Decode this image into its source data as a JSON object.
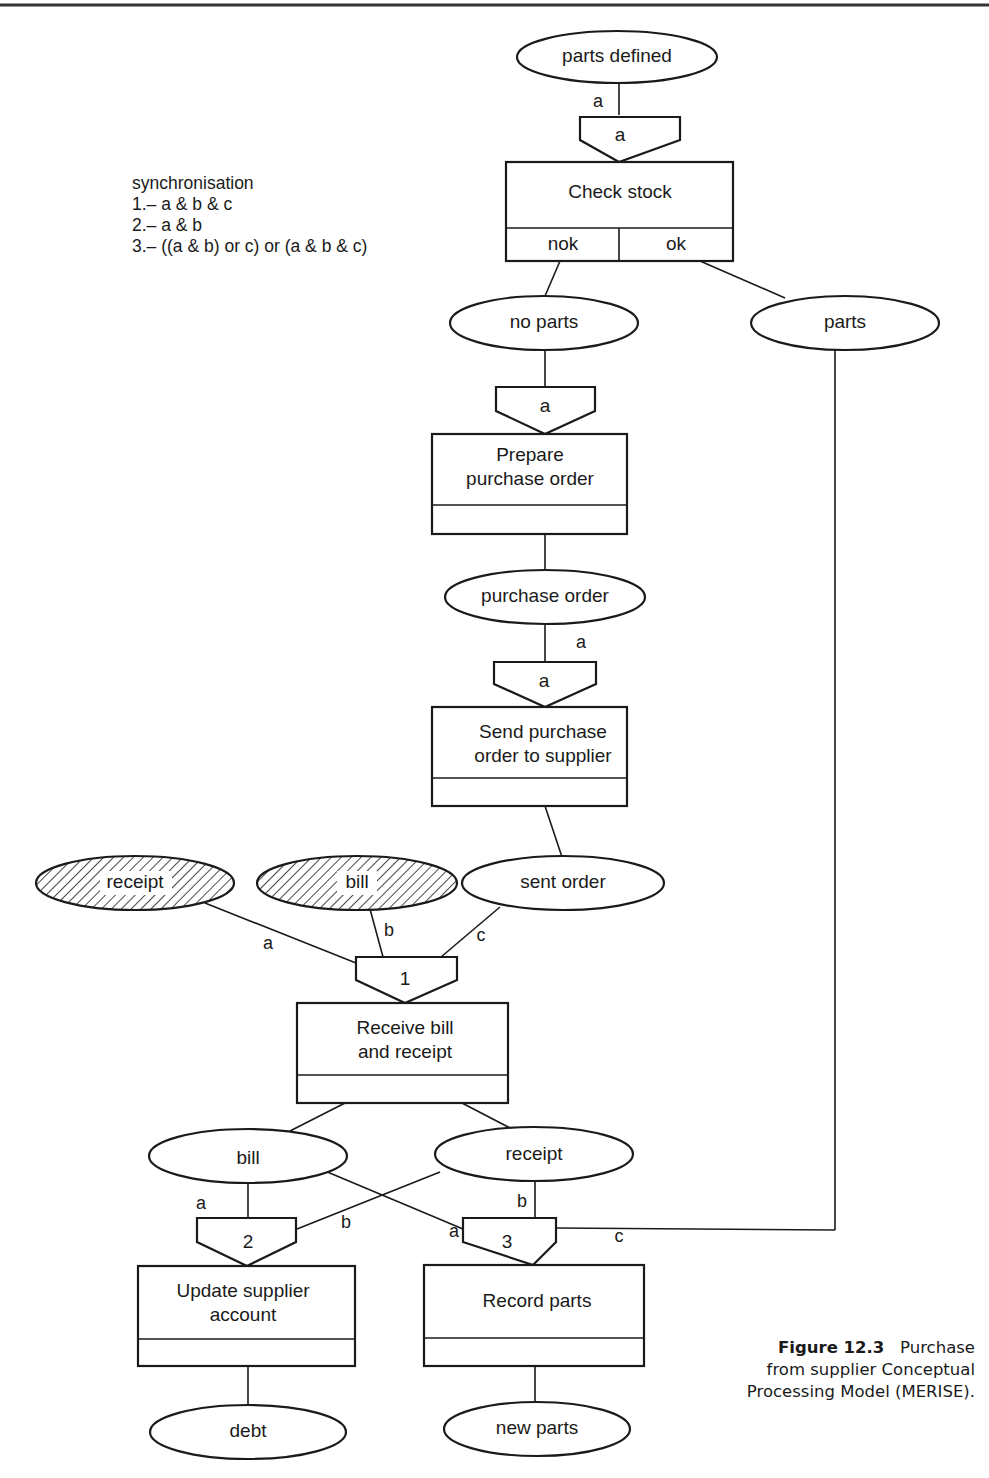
{
  "figure": {
    "caption": {
      "number": "Figure 12.3",
      "text_line1": "Purchase",
      "text_line2": "from supplier Conceptual",
      "text_line3": "Processing Model (MERISE)."
    },
    "synchronisation_legend": {
      "title": "synchronisation",
      "rules": [
        "1.– a & b & c",
        "2.– a & b",
        "3.– ((a & b) or c) or (a & b & c)"
      ]
    },
    "events": {
      "parts_defined": "parts defined",
      "no_parts": "no parts",
      "parts": "parts",
      "purchase_order": "purchase order",
      "receipt_external": "receipt",
      "bill_external": "bill",
      "sent_order": "sent order",
      "bill": "bill",
      "receipt": "receipt",
      "debt": "debt",
      "new_parts": "new parts"
    },
    "synchronisations": {
      "sync_check": "a",
      "sync_prepare": "a",
      "sync_send": "a",
      "sync_receive": "1",
      "sync_update": "2",
      "sync_record": "3"
    },
    "operations": {
      "check_stock": {
        "line1": "Check stock",
        "rule_nok": "nok",
        "rule_ok": "ok"
      },
      "prepare": {
        "line1": "Prepare",
        "line2": "purchase order"
      },
      "send": {
        "line1": "Send purchase",
        "line2": "order to supplier"
      },
      "receive": {
        "line1": "Receive bill",
        "line2": "and receipt"
      },
      "update": {
        "line1": "Update supplier",
        "line2": "account"
      },
      "record": {
        "line1": "Record parts"
      }
    },
    "edge_labels": {
      "parts_defined_to_check": "a",
      "purchase_order_to_send": "a",
      "receipt_to_1": "a",
      "bill_to_1": "b",
      "sent_order_to_1": "c",
      "bill_to_2": "a",
      "receipt_to_2": "b",
      "bill_to_3": "a",
      "receipt_to_3": "b",
      "parts_to_3": "c"
    }
  }
}
